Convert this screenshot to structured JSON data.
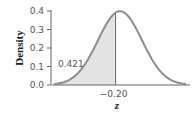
{
  "chart_data": {
    "type": "area",
    "title": "",
    "xlabel": "z",
    "ylabel": "Density",
    "distribution": "standard normal",
    "ylim": [
      0.0,
      0.4
    ],
    "yticks": [
      "0.0",
      "0.1",
      "0.2",
      "0.3",
      "0.4"
    ],
    "xticks": [
      "−0.20"
    ],
    "xlim": [
      -3,
      3
    ],
    "shaded_region": {
      "from": "-inf",
      "to": -0.2,
      "area": 0.421
    },
    "annotations": [
      {
        "text": "0.421",
        "target": "shaded area left of z = -0.20"
      }
    ],
    "grid": false,
    "legend": null
  },
  "colors": {
    "curve": "#8c8c8c",
    "fill": "#e4e4e4",
    "axis": "#666666",
    "text": "#555555"
  }
}
